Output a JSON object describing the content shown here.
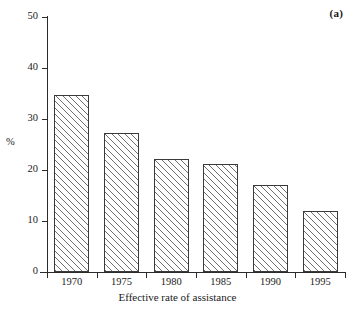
{
  "figure": {
    "panel_label": "(a)",
    "background_color": "#ffffff",
    "line_color": "#2b2b2b",
    "hatch_color": "#6f6f6f"
  },
  "chart_data": {
    "type": "bar",
    "title": "",
    "subtitle": "",
    "xlabel": "Effective rate of assistance",
    "ylabel": "%",
    "categories": [
      "1970",
      "1975",
      "1980",
      "1985",
      "1990",
      "1995"
    ],
    "values": [
      34.7,
      27.2,
      22.2,
      21.2,
      17.0,
      12.0
    ],
    "series": [
      {
        "name": "Effective rate of assistance",
        "values": [
          34.7,
          27.2,
          22.2,
          21.2,
          17.0,
          12.0
        ]
      }
    ],
    "ylim": [
      0,
      50
    ],
    "yticks": [
      0,
      10,
      20,
      30,
      40,
      50
    ],
    "ytick_labels": [
      "0",
      "10",
      "20",
      "30",
      "40",
      "50"
    ],
    "xtick_labels": [
      "1970",
      "1975",
      "1980",
      "1985",
      "1990",
      "1995"
    ],
    "grid": false,
    "legend": false,
    "legend_position": "none",
    "annotations": [
      "(a)"
    ],
    "bar_fill": "white-with-diagonal-hatch",
    "bar_edge_color": "#3a3a3a"
  }
}
